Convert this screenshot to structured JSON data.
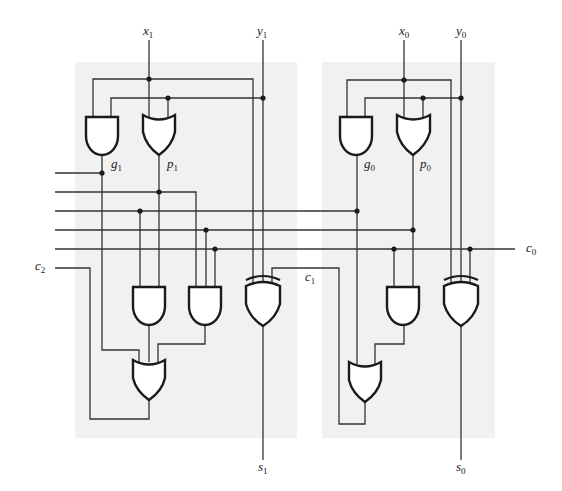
{
  "labels": {
    "x1": {
      "base": "x",
      "sub": "1"
    },
    "y1": {
      "base": "y",
      "sub": "1"
    },
    "x0": {
      "base": "x",
      "sub": "0"
    },
    "y0": {
      "base": "y",
      "sub": "0"
    },
    "g1": {
      "base": "g",
      "sub": "1"
    },
    "p1": {
      "base": "p",
      "sub": "1"
    },
    "g0": {
      "base": "g",
      "sub": "0"
    },
    "p0": {
      "base": "p",
      "sub": "0"
    },
    "c0": {
      "base": "c",
      "sub": "0"
    },
    "c1": {
      "base": "c",
      "sub": "1"
    },
    "c2": {
      "base": "c",
      "sub": "2"
    },
    "s1": {
      "base": "s",
      "sub": "1"
    },
    "s0": {
      "base": "s",
      "sub": "0"
    }
  },
  "stages": [
    {
      "name": "stage-1",
      "inputs": [
        "x1",
        "y1"
      ],
      "outputs": [
        "s1",
        "c2"
      ],
      "gates": [
        "AND g1",
        "OR p1",
        "AND",
        "AND",
        "OR",
        "XOR"
      ]
    },
    {
      "name": "stage-0",
      "inputs": [
        "x0",
        "y0",
        "c0"
      ],
      "outputs": [
        "s0",
        "c1"
      ],
      "gates": [
        "AND g0",
        "OR p0",
        "AND",
        "OR",
        "XOR"
      ]
    }
  ],
  "colors": {
    "panel": "#f1f1f1",
    "wire": "#333333",
    "gate_stroke": "#1a1a1a"
  }
}
